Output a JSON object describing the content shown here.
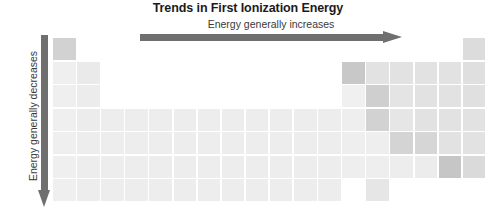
{
  "figure": {
    "title": "Trends in First Ionization Energy",
    "horizontal_label": "Energy generally increases",
    "vertical_label": "Energy generally decreases",
    "arrow_color": "#6f6f6f",
    "title_color": "#1b1b1b",
    "label_color": "#3a3a3a",
    "background": "#ffffff"
  },
  "grid": {
    "columns": 18,
    "rows": 7,
    "origin_x": 53,
    "origin_y": 38,
    "col_pitch": 24.1,
    "row_pitch": 23.5,
    "cell_w": 22.6,
    "cell_h": 22.0,
    "gap_color": "#ffffff"
  },
  "shades": {
    "lightest": "#eeeeee",
    "light": "#e9e9e9",
    "mid_light": "#e3e3e3",
    "mid": "#dcdcdc",
    "mid_dark": "#d2d2d2",
    "dark": "#c8c8c8",
    "darkest": "#bfbfbf"
  },
  "chart_data": {
    "type": "heatmap",
    "title": "Trends in First Ionization Energy",
    "xlabel": "Energy generally increases",
    "ylabel": "Energy generally decreases",
    "legend": [],
    "grid": false,
    "x": [
      1,
      2,
      3,
      4,
      5,
      6,
      7,
      8,
      9,
      10,
      11,
      12,
      13,
      14,
      15,
      16,
      17,
      18
    ],
    "y": [
      1,
      2,
      3,
      4,
      5,
      6,
      7
    ],
    "cells": [
      {
        "row": 1,
        "col": 1,
        "shade": "#d2d2d2"
      },
      {
        "row": 1,
        "col": 18,
        "shade": "#dcdcdc"
      },
      {
        "row": 2,
        "col": 1,
        "shade": "#efefef"
      },
      {
        "row": 2,
        "col": 2,
        "shade": "#eaeaea"
      },
      {
        "row": 2,
        "col": 13,
        "shade": "#c8c8c8"
      },
      {
        "row": 2,
        "col": 14,
        "shade": "#e2e2e2"
      },
      {
        "row": 2,
        "col": 15,
        "shade": "#e2e2e2"
      },
      {
        "row": 2,
        "col": 16,
        "shade": "#e2e2e2"
      },
      {
        "row": 2,
        "col": 17,
        "shade": "#e2e2e2"
      },
      {
        "row": 2,
        "col": 18,
        "shade": "#dfdfdf"
      },
      {
        "row": 3,
        "col": 1,
        "shade": "#efefef"
      },
      {
        "row": 3,
        "col": 2,
        "shade": "#ececec"
      },
      {
        "row": 3,
        "col": 13,
        "shade": "#f0f0f0"
      },
      {
        "row": 3,
        "col": 14,
        "shade": "#cfcfcf"
      },
      {
        "row": 3,
        "col": 15,
        "shade": "#e4e4e4"
      },
      {
        "row": 3,
        "col": 16,
        "shade": "#e2e2e2"
      },
      {
        "row": 3,
        "col": 17,
        "shade": "#e2e2e2"
      },
      {
        "row": 3,
        "col": 18,
        "shade": "#e0e0e0"
      },
      {
        "row": 4,
        "col": 1,
        "shade": "#efefef"
      },
      {
        "row": 4,
        "col": 2,
        "shade": "#ececec"
      },
      {
        "row": 4,
        "col": 3,
        "shade": "#ededed"
      },
      {
        "row": 4,
        "col": 4,
        "shade": "#ededed"
      },
      {
        "row": 4,
        "col": 5,
        "shade": "#ededed"
      },
      {
        "row": 4,
        "col": 6,
        "shade": "#ededed"
      },
      {
        "row": 4,
        "col": 7,
        "shade": "#ededed"
      },
      {
        "row": 4,
        "col": 8,
        "shade": "#ededed"
      },
      {
        "row": 4,
        "col": 9,
        "shade": "#ededed"
      },
      {
        "row": 4,
        "col": 10,
        "shade": "#ededed"
      },
      {
        "row": 4,
        "col": 11,
        "shade": "#ededed"
      },
      {
        "row": 4,
        "col": 12,
        "shade": "#ededed"
      },
      {
        "row": 4,
        "col": 13,
        "shade": "#eeeeee"
      },
      {
        "row": 4,
        "col": 14,
        "shade": "#d2d2d2"
      },
      {
        "row": 4,
        "col": 15,
        "shade": "#e6e6e6"
      },
      {
        "row": 4,
        "col": 16,
        "shade": "#e2e2e2"
      },
      {
        "row": 4,
        "col": 17,
        "shade": "#e2e2e2"
      },
      {
        "row": 4,
        "col": 18,
        "shade": "#e2e2e2"
      },
      {
        "row": 5,
        "col": 1,
        "shade": "#efefef"
      },
      {
        "row": 5,
        "col": 2,
        "shade": "#ededed"
      },
      {
        "row": 5,
        "col": 3,
        "shade": "#ededed"
      },
      {
        "row": 5,
        "col": 4,
        "shade": "#ededed"
      },
      {
        "row": 5,
        "col": 5,
        "shade": "#ededed"
      },
      {
        "row": 5,
        "col": 6,
        "shade": "#ededed"
      },
      {
        "row": 5,
        "col": 7,
        "shade": "#ededed"
      },
      {
        "row": 5,
        "col": 8,
        "shade": "#ededed"
      },
      {
        "row": 5,
        "col": 9,
        "shade": "#ededed"
      },
      {
        "row": 5,
        "col": 10,
        "shade": "#ededed"
      },
      {
        "row": 5,
        "col": 11,
        "shade": "#ededed"
      },
      {
        "row": 5,
        "col": 12,
        "shade": "#ededed"
      },
      {
        "row": 5,
        "col": 13,
        "shade": "#eeeeee"
      },
      {
        "row": 5,
        "col": 14,
        "shade": "#eeeeee"
      },
      {
        "row": 5,
        "col": 15,
        "shade": "#d4d4d4"
      },
      {
        "row": 5,
        "col": 16,
        "shade": "#d6d6d6"
      },
      {
        "row": 5,
        "col": 17,
        "shade": "#e2e2e2"
      },
      {
        "row": 5,
        "col": 18,
        "shade": "#e2e2e2"
      },
      {
        "row": 6,
        "col": 1,
        "shade": "#efefef"
      },
      {
        "row": 6,
        "col": 2,
        "shade": "#ededed"
      },
      {
        "row": 6,
        "col": 3,
        "shade": "#ededed"
      },
      {
        "row": 6,
        "col": 4,
        "shade": "#ededed"
      },
      {
        "row": 6,
        "col": 5,
        "shade": "#ededed"
      },
      {
        "row": 6,
        "col": 6,
        "shade": "#ededed"
      },
      {
        "row": 6,
        "col": 7,
        "shade": "#ededed"
      },
      {
        "row": 6,
        "col": 8,
        "shade": "#ededed"
      },
      {
        "row": 6,
        "col": 9,
        "shade": "#ededed"
      },
      {
        "row": 6,
        "col": 10,
        "shade": "#ededed"
      },
      {
        "row": 6,
        "col": 11,
        "shade": "#ededed"
      },
      {
        "row": 6,
        "col": 12,
        "shade": "#ededed"
      },
      {
        "row": 6,
        "col": 13,
        "shade": "#eeeeee"
      },
      {
        "row": 6,
        "col": 14,
        "shade": "#eeeeee"
      },
      {
        "row": 6,
        "col": 15,
        "shade": "#ededed"
      },
      {
        "row": 6,
        "col": 16,
        "shade": "#ececec"
      },
      {
        "row": 6,
        "col": 17,
        "shade": "#c6c6c6"
      },
      {
        "row": 6,
        "col": 18,
        "shade": "#dadada"
      },
      {
        "row": 7,
        "col": 1,
        "shade": "#efefef"
      },
      {
        "row": 7,
        "col": 2,
        "shade": "#ededed"
      },
      {
        "row": 7,
        "col": 3,
        "shade": "#ededed"
      },
      {
        "row": 7,
        "col": 4,
        "shade": "#ededed"
      },
      {
        "row": 7,
        "col": 5,
        "shade": "#ededed"
      },
      {
        "row": 7,
        "col": 6,
        "shade": "#ededed"
      },
      {
        "row": 7,
        "col": 7,
        "shade": "#ededed"
      },
      {
        "row": 7,
        "col": 8,
        "shade": "#ededed"
      },
      {
        "row": 7,
        "col": 9,
        "shade": "#ededed"
      },
      {
        "row": 7,
        "col": 10,
        "shade": "#ededed"
      },
      {
        "row": 7,
        "col": 11,
        "shade": "#ededed"
      },
      {
        "row": 7,
        "col": 12,
        "shade": "#ededed"
      },
      {
        "row": 7,
        "col": 14,
        "shade": "#e6e6e6"
      }
    ]
  }
}
